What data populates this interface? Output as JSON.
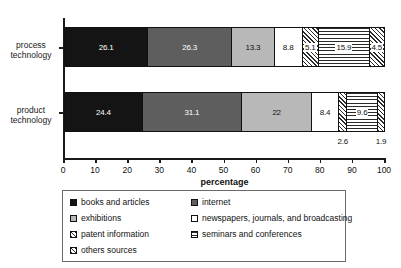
{
  "chart_data": {
    "type": "bar",
    "orientation": "horizontal",
    "stacked": true,
    "normalized_percent": true,
    "title": "",
    "xlabel": "percentage",
    "ylabel": "",
    "xlim": [
      0,
      100
    ],
    "xticks": [
      0,
      10,
      20,
      30,
      40,
      50,
      60,
      70,
      80,
      90,
      100
    ],
    "grid": false,
    "legend_position": "bottom",
    "categories": [
      "process technology",
      "product technology"
    ],
    "series": [
      {
        "name": "books and articles",
        "pattern": "solid-black",
        "color": "#141414",
        "values": [
          26.1,
          24.4
        ]
      },
      {
        "name": "internet",
        "pattern": "solid-dark-gray",
        "color": "#5e5e5e",
        "values": [
          26.3,
          31.1
        ]
      },
      {
        "name": "exhibitions",
        "pattern": "solid-light-gray",
        "color": "#b8b8b8",
        "values": [
          13.3,
          22
        ]
      },
      {
        "name": "newspapers, journals, and broadcasting",
        "pattern": "white",
        "color": "#ffffff",
        "values": [
          8.8,
          8.4
        ]
      },
      {
        "name": "patent information",
        "pattern": "diagonal-hatch",
        "color": "#ffffff",
        "values": [
          5.1,
          2.6
        ]
      },
      {
        "name": "seminars and conferences",
        "pattern": "horizontal-lines",
        "color": "#ffffff",
        "values": [
          15.9,
          9.6
        ]
      },
      {
        "name": "others sources",
        "pattern": "diagonal-hatch",
        "color": "#ffffff",
        "values": [
          4.5,
          1.9
        ]
      }
    ],
    "bars": [
      {
        "category": "process technology",
        "segments": [
          {
            "label": "books and articles",
            "value": 26.1,
            "value_text": "26.1",
            "fill": "f-black",
            "text_class": "on-dark",
            "outside": false
          },
          {
            "label": "internet",
            "value": 26.3,
            "value_text": "26.3",
            "fill": "f-darkgray",
            "text_class": "on-dark",
            "outside": false
          },
          {
            "label": "exhibitions",
            "value": 13.3,
            "value_text": "13.3",
            "fill": "f-lightgray",
            "text_class": "on-light",
            "outside": false
          },
          {
            "label": "newspapers, journals, and broadcasting",
            "value": 8.8,
            "value_text": "8.8",
            "fill": "f-white",
            "text_class": "on-light",
            "outside": false
          },
          {
            "label": "patent information",
            "value": 5.1,
            "value_text": "5.1",
            "fill": "f-hatch",
            "text_class": "on-light",
            "outside": false
          },
          {
            "label": "seminars and conferences",
            "value": 15.9,
            "value_text": "15.9",
            "fill": "f-hlines",
            "text_class": "on-light",
            "outside": false
          },
          {
            "label": "others sources",
            "value": 4.5,
            "value_text": "4.5",
            "fill": "f-hatch",
            "text_class": "on-light",
            "outside": false
          }
        ]
      },
      {
        "category": "product technology",
        "segments": [
          {
            "label": "books and articles",
            "value": 24.4,
            "value_text": "24.4",
            "fill": "f-black",
            "text_class": "on-dark",
            "outside": false
          },
          {
            "label": "internet",
            "value": 31.1,
            "value_text": "31.1",
            "fill": "f-darkgray",
            "text_class": "on-dark",
            "outside": false
          },
          {
            "label": "exhibitions",
            "value": 22,
            "value_text": "22",
            "fill": "f-lightgray",
            "text_class": "on-light",
            "outside": false
          },
          {
            "label": "newspapers, journals, and broadcasting",
            "value": 8.4,
            "value_text": "8.4",
            "fill": "f-white",
            "text_class": "on-light",
            "outside": false
          },
          {
            "label": "patent information",
            "value": 2.6,
            "value_text": "2.6",
            "fill": "f-hatch",
            "text_class": "on-light",
            "outside": true
          },
          {
            "label": "seminars and conferences",
            "value": 9.6,
            "value_text": "9.6",
            "fill": "f-hlines",
            "text_class": "on-light",
            "outside": false
          },
          {
            "label": "others sources",
            "value": 1.9,
            "value_text": "1.9",
            "fill": "f-hatch",
            "text_class": "on-light",
            "outside": true
          }
        ]
      }
    ]
  },
  "axis": {
    "y_labels": [
      {
        "line1": "process",
        "line2": "technology"
      },
      {
        "line1": "product",
        "line2": "technology"
      }
    ],
    "x_title": "percentage",
    "x_tick_labels": [
      "0",
      "10",
      "20",
      "30",
      "40",
      "50",
      "60",
      "70",
      "80",
      "90",
      "100"
    ]
  },
  "legend": {
    "column_a": [
      {
        "label": "books and articles",
        "fill": "f-black"
      },
      {
        "label": "exhibitions",
        "fill": "f-lightgray"
      },
      {
        "label": "patent information",
        "fill": "f-hatch"
      },
      {
        "label": "others sources",
        "fill": "f-hatch"
      }
    ],
    "column_b": [
      {
        "label": "internet",
        "fill": "f-darkgray"
      },
      {
        "label": "newspapers, journals, and broadcasting",
        "fill": "f-white"
      },
      {
        "label": "seminars and conferences",
        "fill": "f-hlines"
      }
    ]
  },
  "colors": {
    "books_and_articles": "#141414",
    "internet": "#5e5e5e",
    "exhibitions": "#b8b8b8",
    "newspapers": "#ffffff",
    "axis": "#1a1a1a",
    "legend_border": "#6a6a6a"
  }
}
